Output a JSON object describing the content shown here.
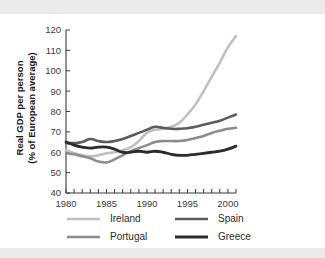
{
  "chart_data": {
    "type": "line",
    "title": "",
    "xlabel": "",
    "ylabel": "Real GDP per person\n(% of European average)",
    "ylabel_line1": "Real GDP per person",
    "ylabel_line2": "(% of European average)",
    "xlim": [
      1980,
      2001
    ],
    "ylim": [
      40,
      120
    ],
    "yticks": [
      40,
      50,
      60,
      70,
      80,
      90,
      100,
      110,
      120
    ],
    "xticks": [
      1980,
      1985,
      1990,
      1995,
      2000
    ],
    "x_minor_tick_step": 1,
    "grid": false,
    "legend_position": "bottom",
    "x": [
      1980,
      1981,
      1982,
      1983,
      1984,
      1985,
      1986,
      1987,
      1988,
      1989,
      1990,
      1991,
      1992,
      1993,
      1994,
      1995,
      1996,
      1997,
      1998,
      1999,
      2000,
      2001
    ],
    "series": [
      {
        "name": "Ireland",
        "color": "#bfbfbf",
        "width": 2.6,
        "values": [
          61.0,
          59.5,
          58.5,
          58.0,
          58.5,
          59.5,
          60.0,
          61.0,
          62.5,
          65.5,
          69.5,
          71.0,
          71.5,
          72.5,
          74.5,
          78.5,
          83.5,
          90.0,
          97.0,
          104.0,
          111.5,
          117.0
        ]
      },
      {
        "name": "Spain",
        "color": "#5c5c5c",
        "width": 2.6,
        "values": [
          64.5,
          64.5,
          65.0,
          66.5,
          65.5,
          65.0,
          65.5,
          66.5,
          68.0,
          69.5,
          71.0,
          72.5,
          72.0,
          71.5,
          71.5,
          71.8,
          72.5,
          73.5,
          74.5,
          75.5,
          77.0,
          78.5
        ]
      },
      {
        "name": "Portugal",
        "color": "#8c8c8c",
        "width": 2.6,
        "values": [
          59.5,
          59.0,
          58.0,
          57.0,
          55.5,
          55.0,
          56.5,
          58.5,
          60.5,
          62.0,
          63.5,
          65.0,
          65.5,
          65.5,
          65.5,
          66.0,
          67.0,
          68.0,
          69.5,
          70.5,
          71.5,
          72.0
        ]
      },
      {
        "name": "Greece",
        "color": "#2b2b2b",
        "width": 2.8,
        "values": [
          65.0,
          63.5,
          62.5,
          62.0,
          62.5,
          62.5,
          61.5,
          60.0,
          60.0,
          60.5,
          60.0,
          60.5,
          60.0,
          59.0,
          58.5,
          58.5,
          59.0,
          59.5,
          60.0,
          60.5,
          61.5,
          63.0
        ]
      }
    ],
    "legend": [
      {
        "label": "Ireland",
        "color": "#bfbfbf",
        "width": 2.6
      },
      {
        "label": "Spain",
        "color": "#5c5c5c",
        "width": 2.6
      },
      {
        "label": "Portugal",
        "color": "#8c8c8c",
        "width": 2.6
      },
      {
        "label": "Greece",
        "color": "#2b2b2b",
        "width": 3.2
      }
    ]
  }
}
